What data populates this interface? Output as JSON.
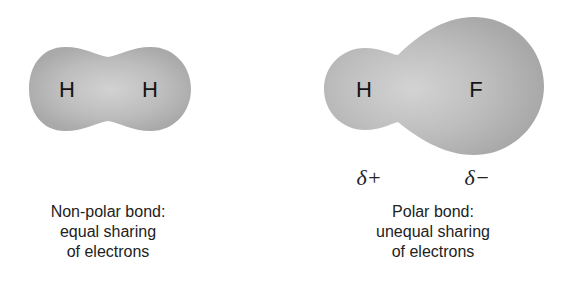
{
  "diagram": {
    "colors": {
      "background": "#ffffff",
      "cloud_edge": "#a8a8a8",
      "cloud_center": "#d4d4d4",
      "text": "#1a1a1a"
    },
    "nonpolar": {
      "atoms": [
        {
          "symbol": "H"
        },
        {
          "symbol": "H"
        }
      ],
      "caption_lines": [
        "Non-polar bond:",
        "equal sharing",
        "of electrons"
      ]
    },
    "polar": {
      "atoms": [
        {
          "symbol": "H"
        },
        {
          "symbol": "F"
        }
      ],
      "partial_charges": [
        {
          "label": "δ+"
        },
        {
          "label": "δ−"
        }
      ],
      "caption_lines": [
        "Polar bond:",
        "unequal sharing",
        "of electrons"
      ]
    }
  }
}
